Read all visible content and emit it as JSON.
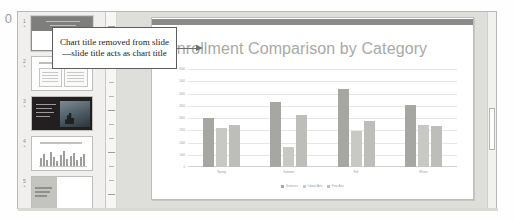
{
  "page_number": "0",
  "annotation": {
    "text": "Chart title removed from slide—slide title acts as chart title",
    "arrow_icon": "arrow-right-icon"
  },
  "thumbnail_pane": {
    "slides": [
      {
        "number": "1",
        "name": "title-slide",
        "selected": true
      },
      {
        "number": "2",
        "name": "content-slide",
        "selected": false
      },
      {
        "number": "3",
        "name": "picture-slide",
        "selected": false
      },
      {
        "number": "4",
        "name": "chart-slide",
        "selected": false
      },
      {
        "number": "5",
        "name": "two-content-slide",
        "selected": false
      }
    ]
  },
  "slide": {
    "title": "Enrollment Comparison by Category"
  },
  "chart_data": {
    "type": "bar",
    "title": "Enrollment Comparison by Category",
    "xlabel": "",
    "ylabel": "",
    "categories": [
      "Spring",
      "Summer",
      "Fall",
      "Winter"
    ],
    "series": [
      {
        "name": "Sciences",
        "color": "#a6a6a3",
        "values": [
          3000,
          4000,
          4800,
          3800
        ]
      },
      {
        "name": "Liberal Arts",
        "color": "#c8c8c5",
        "values": [
          2400,
          1200,
          2200,
          2600
        ]
      },
      {
        "name": "Fine Arts",
        "color": "#bdbdba",
        "values": [
          2600,
          3200,
          2800,
          2500
        ]
      }
    ],
    "ylim": [
      0,
      6000
    ],
    "yticks": [
      "6000",
      "5000",
      "4000",
      "3500",
      "3000",
      "2500",
      "2000",
      "1000",
      "0"
    ],
    "grid": true,
    "legend_position": "bottom"
  },
  "scrollbar": {
    "name": "vertical-scrollbar"
  }
}
